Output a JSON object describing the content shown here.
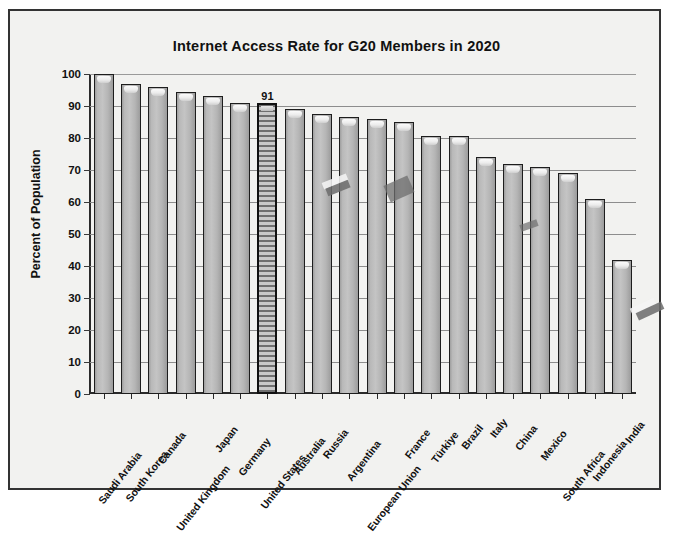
{
  "chart_data": {
    "type": "bar",
    "title": "Internet Access Rate for G20 Members in 2020",
    "xlabel": "",
    "ylabel": "Percent of Population",
    "ylim": [
      0,
      100
    ],
    "ytick_step": 10,
    "yticks": [
      "0",
      "10",
      "20",
      "30",
      "40",
      "50",
      "60",
      "70",
      "80",
      "90",
      "100"
    ],
    "grid": true,
    "legend": "none",
    "highlight_category": "United States",
    "highlight_value_label": "91",
    "categories": [
      "Saudi Arabia",
      "South Korea",
      "Canada",
      "United Kingdom",
      "Japan",
      "Germany",
      "United States",
      "Australia",
      "Russia",
      "Argentina",
      "European Union",
      "France",
      "Türkiye",
      "Brazil",
      "Italy",
      "China",
      "Mexico",
      "South Africa",
      "Indonesia",
      "India"
    ],
    "values": [
      100,
      97,
      96,
      94.5,
      93,
      91,
      91,
      89,
      87.5,
      86.5,
      86,
      85,
      80.5,
      80.5,
      74,
      72,
      71,
      69,
      61,
      42
    ],
    "bars": [
      {
        "label": "Saudi Arabia",
        "value": 100,
        "style": "solid"
      },
      {
        "label": "South Korea",
        "value": 97,
        "style": "solid"
      },
      {
        "label": "Canada",
        "value": 96,
        "style": "solid"
      },
      {
        "label": "United Kingdom",
        "value": 94.5,
        "style": "solid"
      },
      {
        "label": "Japan",
        "value": 93,
        "style": "solid"
      },
      {
        "label": "Germany",
        "value": 91,
        "style": "solid"
      },
      {
        "label": "United States",
        "value": 91,
        "style": "hatched",
        "data_label": "91"
      },
      {
        "label": "Australia",
        "value": 89,
        "style": "solid"
      },
      {
        "label": "Russia",
        "value": 87.5,
        "style": "solid"
      },
      {
        "label": "Argentina",
        "value": 86.5,
        "style": "solid"
      },
      {
        "label": "European Union",
        "value": 86,
        "style": "solid"
      },
      {
        "label": "France",
        "value": 85,
        "style": "solid"
      },
      {
        "label": "Türkiye",
        "value": 80.5,
        "style": "solid"
      },
      {
        "label": "Brazil",
        "value": 80.5,
        "style": "solid"
      },
      {
        "label": "Italy",
        "value": 74,
        "style": "solid"
      },
      {
        "label": "China",
        "value": 72,
        "style": "solid"
      },
      {
        "label": "Mexico",
        "value": 71,
        "style": "solid"
      },
      {
        "label": "South Africa",
        "value": 69,
        "style": "solid"
      },
      {
        "label": "Indonesia",
        "value": 61,
        "style": "solid"
      },
      {
        "label": "India",
        "value": 42,
        "style": "solid"
      }
    ],
    "colors": {
      "bar_fill": "#bdbdbd",
      "bar_border": "#1d1d1d",
      "highlight_fill": "#8a8a8a",
      "plot_background": "#f2f2f0",
      "gridline": "#8d8d8d",
      "text": "#111111"
    }
  }
}
